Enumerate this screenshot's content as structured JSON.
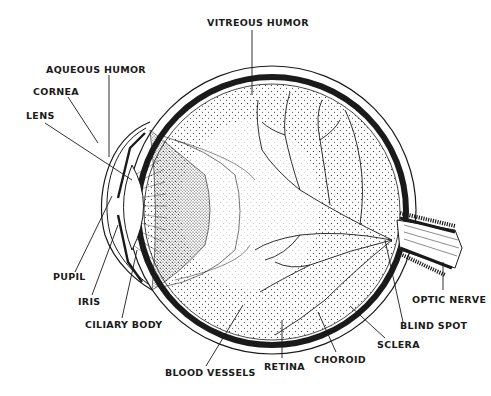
{
  "diagram": {
    "labels": {
      "vitreous_humor": "VITREOUS HUMOR",
      "aqueous_humor": "AQUEOUS HUMOR",
      "cornea": "CORNEA",
      "lens": "LENS",
      "pupil": "PUPIL",
      "iris": "IRIS",
      "ciliary_body": "CILIARY BODY",
      "blood_vessels": "BLOOD VESSELS",
      "retina": "RETINA",
      "choroid": "CHOROID",
      "sclera": "SCLERA",
      "blind_spot": "BLIND SPOT",
      "optic_nerve": "OPTIC NERVE"
    },
    "colors": {
      "ink": "#1a1a1a",
      "background": "#ffffff"
    }
  }
}
